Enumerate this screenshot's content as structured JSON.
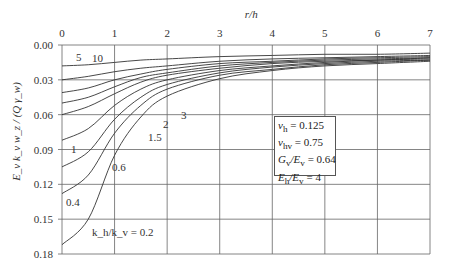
{
  "chart_data": {
    "type": "line",
    "title": "",
    "xlabel": "r/h",
    "ylabel": "E_v k_v w_z / (Q γ_w)",
    "xlim": [
      0,
      7
    ],
    "ylim": [
      0.18,
      0.0
    ],
    "y_inverted": true,
    "x_ticks": [
      "0",
      "1",
      "2",
      "3",
      "4",
      "5",
      "6",
      "7"
    ],
    "y_ticks": [
      "0.00",
      "0.03",
      "0.06",
      "0.09",
      "0.12",
      "0.15",
      "0.18"
    ],
    "grid": true,
    "x_axis_position": "top",
    "x": [
      0,
      0.5,
      1,
      1.5,
      2,
      3,
      4,
      5,
      6,
      7
    ],
    "series": [
      {
        "name": "k_h/k_v = 10",
        "values": [
          0.018,
          0.017,
          0.015,
          0.013,
          0.012,
          0.01,
          0.009,
          0.008,
          0.008,
          0.007
        ]
      },
      {
        "name": "k_h/k_v = 5",
        "values": [
          0.03,
          0.027,
          0.023,
          0.02,
          0.018,
          0.014,
          0.012,
          0.011,
          0.01,
          0.009
        ]
      },
      {
        "name": "k_h/k_v = 3",
        "values": [
          0.041,
          0.037,
          0.03,
          0.025,
          0.021,
          0.016,
          0.014,
          0.012,
          0.011,
          0.01
        ]
      },
      {
        "name": "k_h/k_v = 2",
        "values": [
          0.05,
          0.045,
          0.036,
          0.028,
          0.024,
          0.018,
          0.015,
          0.013,
          0.012,
          0.011
        ]
      },
      {
        "name": "k_h/k_v = 1.5",
        "values": [
          0.06,
          0.053,
          0.042,
          0.032,
          0.026,
          0.02,
          0.016,
          0.014,
          0.013,
          0.011
        ]
      },
      {
        "name": "k_h/k_v = 1",
        "values": [
          0.082,
          0.072,
          0.052,
          0.038,
          0.03,
          0.022,
          0.018,
          0.015,
          0.013,
          0.012
        ]
      },
      {
        "name": "k_h/k_v = 0.6",
        "values": [
          0.105,
          0.092,
          0.064,
          0.045,
          0.034,
          0.024,
          0.019,
          0.016,
          0.014,
          0.013
        ]
      },
      {
        "name": "k_h/k_v = 0.4",
        "values": [
          0.128,
          0.112,
          0.076,
          0.052,
          0.038,
          0.026,
          0.021,
          0.017,
          0.015,
          0.013
        ]
      },
      {
        "name": "k_h/k_v = 0.2",
        "values": [
          0.172,
          0.15,
          0.095,
          0.062,
          0.044,
          0.029,
          0.022,
          0.018,
          0.016,
          0.014
        ]
      }
    ],
    "curve_labels": [
      {
        "text": "10",
        "x_px": 92,
        "y_px": 62
      },
      {
        "text": "5",
        "x_px": 76,
        "y_px": 61
      },
      {
        "text": "3",
        "x_px": 181,
        "y_px": 119
      },
      {
        "text": "2",
        "x_px": 163,
        "y_px": 128
      },
      {
        "text": "1.5",
        "x_px": 148,
        "y_px": 141
      },
      {
        "text": "1",
        "x_px": 71,
        "y_px": 153
      },
      {
        "text": "0.6",
        "x_px": 112,
        "y_px": 171
      },
      {
        "text": "0.4",
        "x_px": 66,
        "y_px": 206
      },
      {
        "text": "k_h/k_v = 0.2",
        "x_px": 92,
        "y_px": 236
      }
    ],
    "legend": {
      "position": "inside-center-right",
      "entries": [
        "ν_h = 0.125",
        "ν_hv = 0.75",
        "G_v/E_v = 0.64",
        "E_h/E_v = 4"
      ]
    }
  },
  "legend": {
    "nu_h": "ν",
    "nu_h_sub": "h",
    "nu_h_val": " = 0.125",
    "nu_hv": "ν",
    "nu_hv_sub": "hv",
    "nu_hv_val": " = 0.75",
    "g": "G",
    "g_sub": "v",
    "g_mid": "/E",
    "g_sub2": "v",
    "g_val": " = 0.64",
    "e": "E",
    "e_sub": "h",
    "e_mid": "/E",
    "e_sub2": "v",
    "e_val": " = 4"
  }
}
